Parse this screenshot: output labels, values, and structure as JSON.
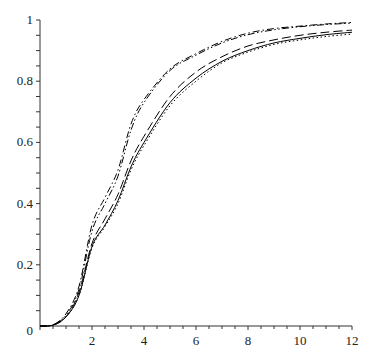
{
  "chart_data": {
    "type": "line",
    "title": "",
    "xlabel": "",
    "ylabel": "",
    "xlim": [
      0,
      12
    ],
    "ylim": [
      0,
      1
    ],
    "grid": false,
    "legend": null,
    "x_ticks": [
      2,
      4,
      6,
      8,
      10,
      12
    ],
    "x_tick_labels": [
      "2",
      "4",
      "6",
      "8",
      "10",
      "12"
    ],
    "y_ticks": [
      0,
      0.2,
      0.4,
      0.6,
      0.8,
      1
    ],
    "y_tick_labels": [
      "0",
      "0.2",
      "0.4",
      "0.6",
      "0.8",
      "1"
    ],
    "x": [
      0,
      0.5,
      1,
      1.5,
      2,
      2.5,
      3,
      3.5,
      4,
      5,
      6,
      7,
      8,
      9,
      10,
      11,
      12
    ],
    "series": [
      {
        "name": "solid",
        "style": "solid",
        "values": [
          0,
          0.003,
          0.03,
          0.1,
          0.26,
          0.33,
          0.41,
          0.52,
          0.6,
          0.73,
          0.81,
          0.865,
          0.9,
          0.925,
          0.94,
          0.952,
          0.96
        ]
      },
      {
        "name": "dashed",
        "style": "dash",
        "values": [
          0,
          0.003,
          0.03,
          0.11,
          0.27,
          0.35,
          0.43,
          0.54,
          0.62,
          0.75,
          0.83,
          0.88,
          0.915,
          0.935,
          0.95,
          0.96,
          0.967
        ]
      },
      {
        "name": "dotted",
        "style": "dot",
        "values": [
          0,
          0.003,
          0.03,
          0.1,
          0.255,
          0.325,
          0.4,
          0.51,
          0.59,
          0.72,
          0.8,
          0.86,
          0.895,
          0.92,
          0.935,
          0.946,
          0.954
        ]
      },
      {
        "name": "dash-dot",
        "style": "dashdot",
        "values": [
          0,
          0.004,
          0.04,
          0.13,
          0.33,
          0.42,
          0.51,
          0.66,
          0.74,
          0.84,
          0.89,
          0.93,
          0.957,
          0.972,
          0.98,
          0.987,
          0.992
        ]
      },
      {
        "name": "dash-dot-dot",
        "style": "dashdotdot",
        "values": [
          0,
          0.004,
          0.035,
          0.12,
          0.31,
          0.4,
          0.49,
          0.64,
          0.73,
          0.835,
          0.885,
          0.925,
          0.952,
          0.968,
          0.978,
          0.985,
          0.99
        ]
      }
    ],
    "colors": {
      "line": "#000000",
      "axis": "#333333"
    }
  }
}
